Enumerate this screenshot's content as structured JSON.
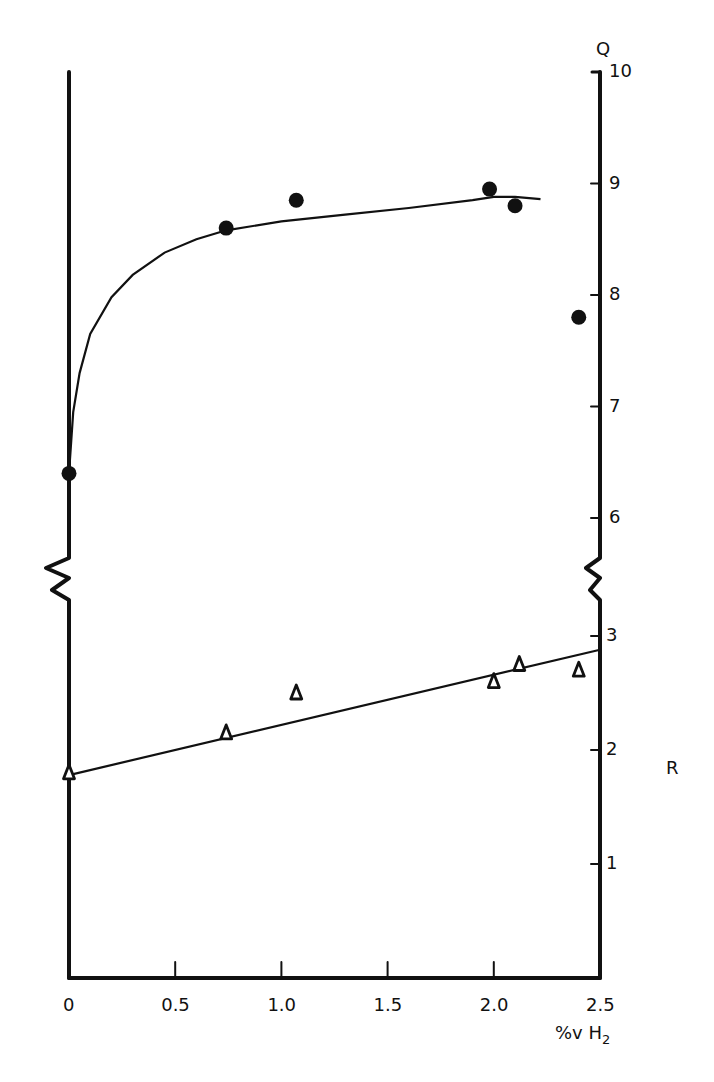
{
  "chart_data": {
    "type": "scatter",
    "title": "",
    "xlabel": "%v H2",
    "xlabel_main": "%v H",
    "xlabel_sub": "2",
    "x_ticks": [
      "0",
      "0.5",
      "1.0",
      "1.5",
      "2.0",
      "2.5"
    ],
    "x_tick_values": [
      0,
      0.5,
      1.0,
      1.5,
      2.0,
      2.5
    ],
    "xlim": [
      0,
      2.5
    ],
    "y_axes": [
      {
        "name": "Q",
        "label": "Q",
        "ticks": [
          "6",
          "7",
          "8",
          "9",
          "10"
        ],
        "tick_values": [
          6,
          7,
          8,
          9,
          10
        ],
        "ylim": [
          6,
          10
        ],
        "broken_below": true
      },
      {
        "name": "R",
        "label": "R",
        "ticks": [
          "1",
          "2",
          "3"
        ],
        "tick_values": [
          1,
          2,
          3
        ],
        "ylim": [
          0,
          3
        ],
        "broken_above": true
      }
    ],
    "grid": false,
    "legend": "none",
    "series": [
      {
        "name": "Q",
        "marker": "filled-circle",
        "axis": "Q",
        "x": [
          0,
          0.74,
          1.07,
          1.98,
          2.1,
          2.4
        ],
        "values": [
          6.4,
          8.6,
          8.85,
          8.95,
          8.8,
          7.8
        ],
        "fit": {
          "type": "saturating-curve",
          "x": [
            0,
            0.02,
            0.05,
            0.1,
            0.2,
            0.3,
            0.45,
            0.6,
            0.74,
            1.0,
            1.3,
            1.6,
            1.9,
            2.0,
            2.1,
            2.22
          ],
          "y": [
            6.4,
            6.95,
            7.3,
            7.65,
            7.98,
            8.18,
            8.38,
            8.5,
            8.58,
            8.66,
            8.72,
            8.78,
            8.85,
            8.88,
            8.88,
            8.86
          ]
        }
      },
      {
        "name": "R",
        "marker": "open-triangle",
        "axis": "R",
        "x": [
          0,
          0.74,
          1.07,
          2.0,
          2.12,
          2.4
        ],
        "values": [
          1.8,
          2.15,
          2.5,
          2.6,
          2.75,
          2.7
        ],
        "fit": {
          "type": "linear",
          "x": [
            0,
            2.5
          ],
          "y": [
            1.78,
            2.88
          ]
        }
      }
    ]
  }
}
